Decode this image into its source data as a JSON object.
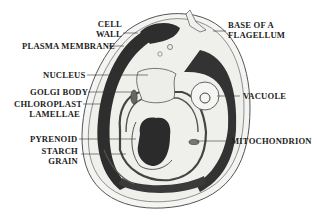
{
  "diagram": {
    "labels": {
      "cell_wall_1": "CELL",
      "cell_wall_2": "WALL",
      "plasma_membrane": "PLASMA MEMBRANE",
      "nucleus": "NUCLEUS",
      "golgi_body": "GOLGI BODY",
      "chloroplast_1": "CHLOROPLAST",
      "chloroplast_2": "LAMELLAE",
      "pyrenoid": "PYRENOID",
      "starch_1": "STARCH",
      "starch_2": "GRAIN",
      "flagellum_1": "BASE OF A",
      "flagellum_2": "FLAGELLUM",
      "vacuole": "VACUOLE",
      "mitochondrion": "MITOCHONDRION"
    },
    "colors": {
      "ink": "#2a2a2a",
      "fill": "#f2f2f0",
      "background": "#ffffff"
    }
  }
}
